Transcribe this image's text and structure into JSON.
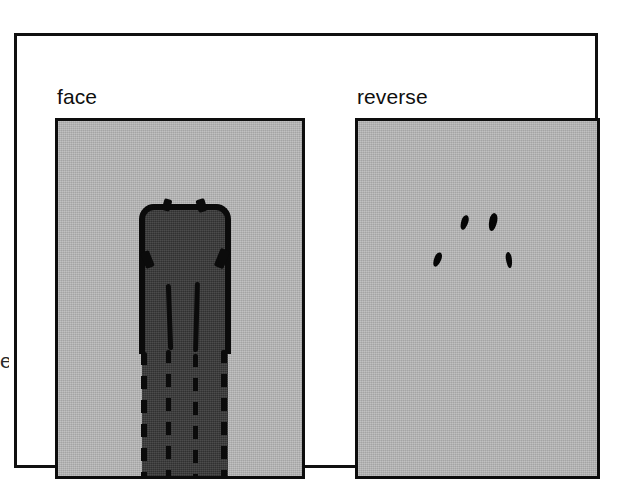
{
  "figure": {
    "background_color": "#ffffff",
    "frame_color": "#101010",
    "panel_background_color": "#b6b6b6",
    "panel_border_color": "#0d0d0d",
    "specimen_fill_color": "#3c3c3c",
    "ink_color": "#0b0b0b",
    "edge_artifact_text": "e"
  },
  "panels": [
    {
      "id": "face",
      "label": "face",
      "content_description": "dark elongated specimen outlined in heavy black, running from upper-middle to the bottom edge of the panel"
    },
    {
      "id": "reverse",
      "label": "reverse",
      "content_description": "four small black elongated marks scattered in the upper-middle area"
    }
  ],
  "reverse_marks": [
    {
      "id": "mark-1"
    },
    {
      "id": "mark-2"
    },
    {
      "id": "mark-3"
    },
    {
      "id": "mark-4"
    }
  ]
}
